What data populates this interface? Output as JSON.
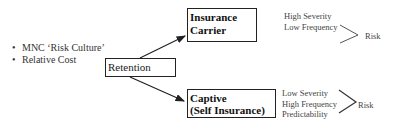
{
  "factors": {
    "items": [
      {
        "label": "MNC ‘Risk Culture’"
      },
      {
        "label": "Relative Cost"
      }
    ],
    "bullet": "•"
  },
  "retention": {
    "label": "Retention"
  },
  "insurance_carrier": {
    "title_line1": "Insurance",
    "title_line2": "Carrier",
    "attributes": [
      "High Severity",
      "Low Frequency"
    ],
    "outcome": "Risk"
  },
  "captive": {
    "title_line1": "Captive",
    "title_line2": "(Self Insurance)",
    "attributes": [
      "Low Severity",
      "High Frequency",
      "Predictability"
    ],
    "outcome": "Risk"
  }
}
